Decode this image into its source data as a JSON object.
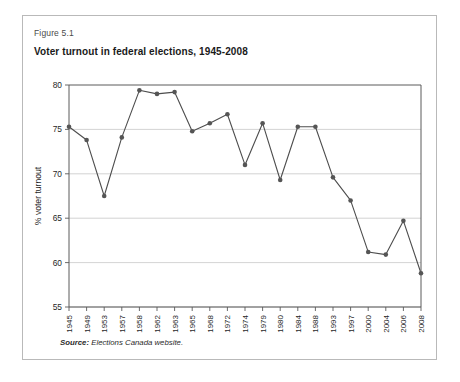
{
  "figure": {
    "label": "Figure 5.1",
    "title": "Voter turnout in federal elections, 1945-2008",
    "source_prefix": "Source:",
    "source_text": "Elections Canada website."
  },
  "colors": {
    "line": "#4d4d4d",
    "marker": "#555555",
    "grid": "#c8c8c8",
    "axis": "#5a5a5a",
    "border": "#b9b9b9",
    "background": "#ffffff"
  },
  "chart_data": {
    "type": "line",
    "title": "Voter turnout in federal elections, 1945-2008",
    "xlabel": "",
    "ylabel": "% voter turnout",
    "ylim": [
      55,
      80
    ],
    "yticks": [
      55,
      60,
      65,
      70,
      75,
      80
    ],
    "grid": true,
    "legend": null,
    "categories": [
      "1945",
      "1949",
      "1953",
      "1957",
      "1958",
      "1962",
      "1963",
      "1965",
      "1968",
      "1972",
      "1974",
      "1979",
      "1980",
      "1984",
      "1988",
      "1993",
      "1997",
      "2000",
      "2004",
      "2006",
      "2008"
    ],
    "values": [
      75.3,
      73.8,
      67.5,
      74.1,
      79.4,
      79.0,
      79.2,
      74.8,
      75.7,
      76.7,
      71.0,
      75.7,
      69.3,
      75.3,
      75.3,
      69.6,
      67.0,
      61.2,
      60.9,
      64.7,
      58.8
    ]
  }
}
